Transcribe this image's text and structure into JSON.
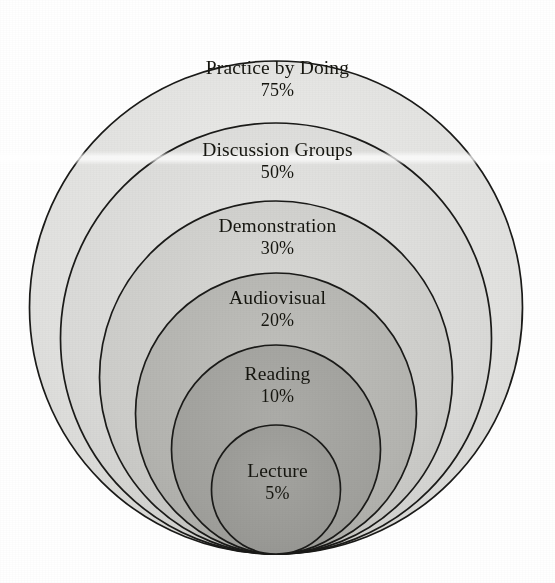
{
  "figure": {
    "kind": "nested-circles-cone-of-learning",
    "background_color": "#ffffff",
    "outline_color": "#1a1a18",
    "text_color": "#15150f",
    "canvas": {
      "width": 555,
      "height": 583
    },
    "geometry_note": "six circles tangent at common bottom point",
    "center_x": 276,
    "bottom_tangent_y": 554,
    "scan_artifact_y": 158
  },
  "chart_data": {
    "type": "pie",
    "title": "",
    "subtitle": "",
    "xlabel": "",
    "ylabel": "",
    "legend_position": "none",
    "grid": false,
    "categories": [
      "Practice by Doing",
      "Discussion Groups",
      "Demonstration",
      "Audiovisual",
      "Reading",
      "Lecture"
    ],
    "values": [
      75,
      50,
      30,
      20,
      10,
      5
    ],
    "value_labels": [
      "75%",
      "50%",
      "30%",
      "20%",
      "10%",
      "5%"
    ],
    "series": [
      {
        "name": "Average Retention Rate",
        "values": [
          75,
          50,
          30,
          20,
          10,
          5
        ]
      }
    ]
  },
  "rings": [
    {
      "id": "practice-by-doing",
      "label": "Practice by Doing",
      "percent_label": "75%",
      "percent": 75,
      "fill": "#e3e3e1",
      "diameter": 493,
      "top_y": 40,
      "label_y": 58,
      "order": 1
    },
    {
      "id": "discussion-groups",
      "label": "Discussion Groups",
      "percent_label": "50%",
      "percent": 50,
      "fill": "#dcdcda",
      "diameter": 431,
      "top_y": 122,
      "label_y": 140,
      "order": 2
    },
    {
      "id": "demonstration",
      "label": "Demonstration",
      "percent_label": "30%",
      "percent": 30,
      "fill": "#cfcfcc",
      "diameter": 353,
      "top_y": 200,
      "label_y": 216,
      "order": 3
    },
    {
      "id": "audiovisual",
      "label": "Audiovisual",
      "percent_label": "20%",
      "percent": 20,
      "fill": "#b6b6b2",
      "diameter": 281,
      "top_y": 272,
      "label_y": 288,
      "order": 4
    },
    {
      "id": "reading",
      "label": "Reading",
      "percent_label": "10%",
      "percent": 10,
      "fill": "#a3a39f",
      "diameter": 209,
      "top_y": 344,
      "label_y": 364,
      "order": 5
    },
    {
      "id": "lecture",
      "label": "Lecture",
      "percent_label": "5%",
      "percent": 5,
      "fill": "#9b9b97",
      "diameter": 129,
      "top_y": 424,
      "label_y": 461,
      "order": 6
    }
  ]
}
